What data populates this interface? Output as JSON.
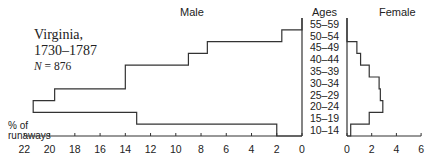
{
  "title": {
    "line1": "Virginia,",
    "line2": "1730–1787",
    "n_label": "N",
    "n_value": "= 876"
  },
  "headers": {
    "male": "Male",
    "ages": "Ages",
    "female": "Female"
  },
  "y_axis_label": {
    "line1": "% of",
    "line2": "runaways"
  },
  "chart_data": {
    "type": "bar",
    "subtype": "population-pyramid (step outline)",
    "categories": [
      "10–14",
      "15–19",
      "20–24",
      "25–29",
      "30–34",
      "35–39",
      "40–44",
      "45–49",
      "50–54",
      "55–59"
    ],
    "category_label": "Ages",
    "series": [
      {
        "name": "Male",
        "values": [
          2.0,
          13.1,
          21.3,
          19.6,
          14.0,
          14.0,
          9.0,
          7.5,
          1.6,
          0
        ]
      },
      {
        "name": "Female",
        "values": [
          0.3,
          1.8,
          2.9,
          2.7,
          2.6,
          1.8,
          1.1,
          0.8,
          0,
          0
        ]
      }
    ],
    "xlabel": "% of runaways",
    "male_axis": {
      "range": [
        22,
        0
      ],
      "ticks": [
        22,
        20,
        18,
        16,
        14,
        12,
        10,
        8,
        6,
        4,
        2,
        0
      ]
    },
    "female_axis": {
      "range": [
        0,
        6
      ],
      "ticks": [
        0,
        2,
        4,
        6
      ]
    },
    "grid": false,
    "legend": "none (series labeled by column headers Male / Female)"
  }
}
